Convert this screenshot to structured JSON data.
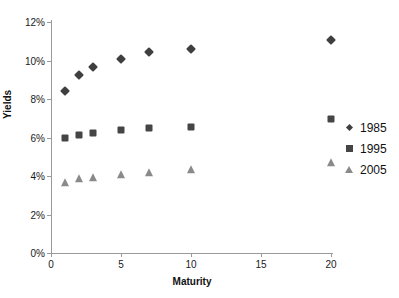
{
  "chart_data": {
    "type": "scatter",
    "title": "",
    "xlabel": "Maturity",
    "ylabel": "Yields",
    "xlim": [
      0,
      20
    ],
    "ylim": [
      0,
      0.12
    ],
    "grid": false,
    "legend_position": "right",
    "x_ticks": [
      "0",
      "5",
      "10",
      "15",
      "20"
    ],
    "x_tick_values": [
      0,
      5,
      10,
      15,
      20
    ],
    "y_ticks": [
      "0%",
      "2%",
      "4%",
      "6%",
      "8%",
      "10%",
      "12%"
    ],
    "y_tick_values": [
      0,
      2,
      4,
      6,
      8,
      10,
      12
    ],
    "x": [
      1,
      2,
      3,
      5,
      7,
      10,
      20
    ],
    "series": [
      {
        "name": "1985",
        "marker": "diamond",
        "color": "#3f3f3f",
        "values": [
          8.4,
          9.25,
          9.65,
          10.1,
          10.45,
          10.6,
          11.05
        ]
      },
      {
        "name": "1995",
        "marker": "square",
        "color": "#454545",
        "values": [
          5.95,
          6.15,
          6.25,
          6.4,
          6.5,
          6.55,
          6.95
        ]
      },
      {
        "name": "2005",
        "marker": "triangle",
        "color": "#8a8a8a",
        "values": [
          3.65,
          3.85,
          3.9,
          4.05,
          4.15,
          4.3,
          4.65
        ]
      }
    ]
  },
  "legend": {
    "items": [
      {
        "label": "1985",
        "marker": "diamond",
        "color": "#3f3f3f"
      },
      {
        "label": "1995",
        "marker": "square",
        "color": "#454545"
      },
      {
        "label": "2005",
        "marker": "triangle",
        "color": "#8a8a8a"
      }
    ]
  }
}
